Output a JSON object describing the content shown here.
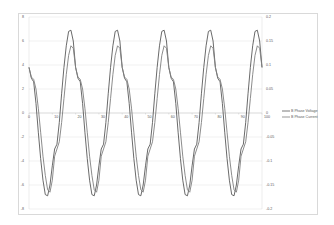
{
  "chart_data": {
    "type": "line",
    "title": "",
    "xlabel": "",
    "ylabel": "",
    "ylabel_right": "",
    "x_ticks": [
      "0",
      "10",
      "20",
      "30",
      "40",
      "50",
      "60",
      "70",
      "80",
      "90",
      "100"
    ],
    "y_left_ticks": [
      "8",
      "6",
      "4",
      "2",
      "0",
      "-2",
      "-4",
      "-6",
      "-8"
    ],
    "y_right_ticks": [
      "0.2",
      "0.15",
      "0.1",
      "0.05",
      "0",
      "-0.05",
      "-0.1",
      "-0.15",
      "-0.2"
    ],
    "xlim": [
      0,
      100
    ],
    "ylim_left": [
      -8,
      8
    ],
    "ylim_right": [
      -0.2,
      0.2
    ],
    "grid": true,
    "legend_position": "right",
    "series": [
      {
        "name": "B Phase Voltage",
        "axis": "left",
        "color": "#595959",
        "period": 20,
        "cycle_values": [
          3.8,
          2.9,
          2.6,
          0.8,
          -1.6,
          -3.8,
          -5.6,
          -6.8,
          -6.9,
          -6.0,
          -4.4,
          -3.0,
          -2.6,
          -0.8,
          1.6,
          3.8,
          5.6,
          6.8,
          6.9,
          6.0,
          4.4
        ],
        "x": "0..100 step 1",
        "peak": 6.9,
        "trough": -6.9
      },
      {
        "name": "B Phase Current",
        "axis": "right",
        "color": "#7f7f7f",
        "period": 20,
        "cycle_values": [
          0.095,
          0.075,
          0.07,
          0.05,
          0.01,
          -0.04,
          -0.09,
          -0.13,
          -0.16,
          -0.165,
          -0.14,
          -0.09,
          -0.075,
          -0.06,
          -0.02,
          0.03,
          0.08,
          0.12,
          0.14,
          0.135,
          0.095
        ],
        "x": "0..100 step 1",
        "peak": 0.14,
        "trough": -0.165
      }
    ]
  },
  "legend": {
    "items": [
      {
        "label": "B Phase Voltage",
        "color": "#595959"
      },
      {
        "label": "B Phase Current",
        "color": "#7f7f7f"
      }
    ]
  }
}
